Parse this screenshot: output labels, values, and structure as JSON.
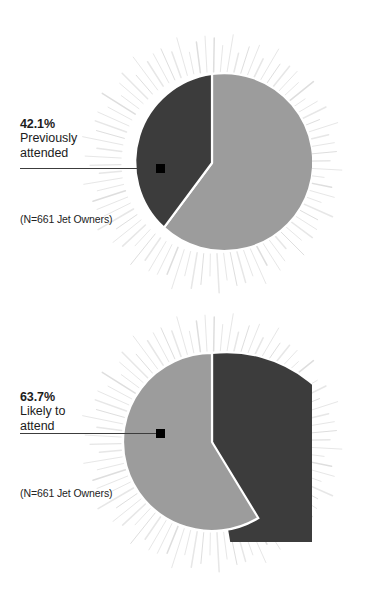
{
  "figure": {
    "background_color": "#ffffff",
    "slice_dark_color": "#3c3c3c",
    "slice_light_color": "#9c9c9c",
    "ray_color": "#dddddd",
    "marker_color": "#000000",
    "leader_color": "#3c3c3c"
  },
  "chart_data": [
    {
      "type": "pie",
      "title": "",
      "annotation": "42.1% Previously attended",
      "labels": [
        "Previously attended",
        "Did not previously attend"
      ],
      "values": [
        42.1,
        57.9
      ],
      "colors": [
        "#3c3c3c",
        "#9c9c9c"
      ],
      "highlight_label": "Previously attended",
      "highlight_value": 42.1,
      "sample_note": "(N=661 Jet Owners)",
      "sample_size": 661,
      "legend": "none",
      "grid": false
    },
    {
      "type": "pie",
      "title": "",
      "annotation": "63.7% Likely to attend",
      "labels": [
        "Likely to attend",
        "Not likely to attend"
      ],
      "values": [
        63.7,
        36.3
      ],
      "colors": [
        "#9c9c9c",
        "#3c3c3c"
      ],
      "highlight_label": "Likely to attend",
      "highlight_value": 63.7,
      "sample_note": "(N=661 Jet Owners)",
      "sample_size": 661,
      "legend": "none",
      "grid": false
    }
  ],
  "charts": [
    {
      "percent": "42.1%",
      "description_line_1": "Previously",
      "description_line_2": "attended",
      "sample_note": "(N=661 Jet Owners)"
    },
    {
      "percent": "63.7%",
      "description_line_1": "Likely to",
      "description_line_2": "attend",
      "sample_note": "(N=661 Jet Owners)"
    }
  ]
}
